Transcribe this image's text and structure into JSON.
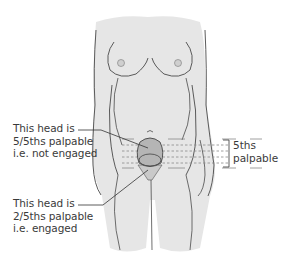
{
  "figure": {
    "body_fill": "#e6e6e6",
    "outline_color": "#4a4a4a",
    "head_fill": "#b5b5b5",
    "pelvis_fill": "#c9c9c9"
  },
  "labels": {
    "not_engaged": {
      "line1": "This head is",
      "line2": "5/5ths palpable",
      "line3": "i.e. not engaged"
    },
    "engaged": {
      "line1": "This head is",
      "line2": "2/5ths palpable",
      "line3": "i.e. engaged"
    },
    "fifths_scale": {
      "line1": "5ths",
      "line2": "palpable"
    }
  }
}
